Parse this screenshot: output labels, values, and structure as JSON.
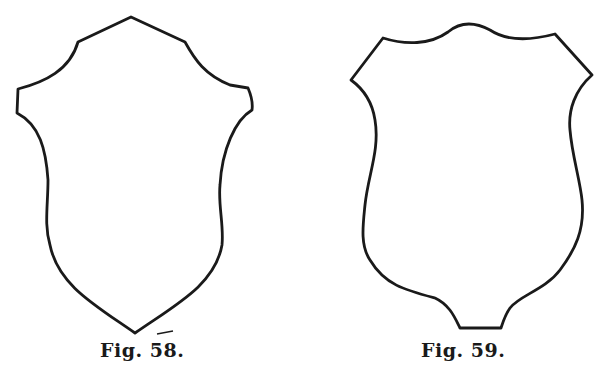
{
  "figures": [
    {
      "id": "fig58",
      "caption": "Fig. 58.",
      "description": "Shield outline with pointed top, notched shoulders, and pointed base"
    },
    {
      "id": "fig59",
      "caption": "Fig. 59.",
      "description": "Shield outline with wavy top, pointed side corners, and flat truncated base"
    }
  ],
  "colors": {
    "stroke": "#1a1a1a",
    "background": "#ffffff"
  }
}
